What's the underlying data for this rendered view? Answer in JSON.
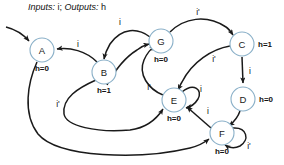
{
  "title": {
    "inputs_label": "Inputs:",
    "inputs_value": "i;",
    "outputs_label": "Outputs:",
    "outputs_value": "h"
  },
  "diagram": {
    "kind": "finite-state-machine",
    "stroke_color": "#1a1a1a",
    "state_stroke_color": "#8ab0c8",
    "state_fill_color": "#ffffff"
  },
  "states": [
    {
      "id": "A",
      "name": "A",
      "output": "h=0",
      "cx": 42,
      "cy": 50,
      "r": 12,
      "output_dx": 0,
      "output_dy": 18
    },
    {
      "id": "B",
      "name": "B",
      "output": "h=1",
      "cx": 104,
      "cy": 72,
      "r": 12,
      "output_dx": 0,
      "output_dy": 18
    },
    {
      "id": "G",
      "name": "G",
      "output": "h=0",
      "cx": 161,
      "cy": 41,
      "r": 12,
      "output_dx": 0,
      "output_dy": 18
    },
    {
      "id": "C",
      "name": "C",
      "output": "h=1",
      "cx": 242,
      "cy": 44,
      "r": 12,
      "output_dx": 24,
      "output_dy": 0
    },
    {
      "id": "D",
      "name": "D",
      "output": "h=0",
      "cx": 243,
      "cy": 99,
      "r": 12,
      "output_dx": 24,
      "output_dy": 0
    },
    {
      "id": "E",
      "name": "E",
      "output": "h=0",
      "cx": 174,
      "cy": 100,
      "r": 12,
      "output_dx": 0,
      "output_dy": 18
    },
    {
      "id": "F",
      "name": "F",
      "output": "h=0",
      "cx": 222,
      "cy": 133,
      "r": 12,
      "output_dx": 0,
      "output_dy": 18
    }
  ],
  "transitions": [
    {
      "id": "init-A",
      "from": "",
      "to": "A",
      "label": "",
      "label_x": 0,
      "label_y": 0
    },
    {
      "id": "B-to-A",
      "from": "B",
      "to": "A",
      "label": "i",
      "label_x": 78,
      "label_y": 44
    },
    {
      "id": "G-to-B",
      "from": "G",
      "to": "B",
      "label": "i",
      "label_x": 120,
      "label_y": 22
    },
    {
      "id": "B-to-G",
      "from": "B",
      "to": "G",
      "label": "",
      "label_x": 0,
      "label_y": 0
    },
    {
      "id": "G-to-C",
      "from": "G",
      "to": "C",
      "label": "i'",
      "label_x": 198,
      "label_y": 12
    },
    {
      "id": "E-to-G",
      "from": "E",
      "to": "G",
      "label": "i'",
      "label_x": 149,
      "label_y": 87
    },
    {
      "id": "C-to-E",
      "from": "C",
      "to": "E",
      "label": "i'",
      "label_x": 214,
      "label_y": 59
    },
    {
      "id": "C-to-D",
      "from": "C",
      "to": "D",
      "label": "i",
      "label_x": 250,
      "label_y": 71
    },
    {
      "id": "D-to-F",
      "from": "D",
      "to": "F",
      "label": "",
      "label_x": 0,
      "label_y": 0
    },
    {
      "id": "E-to-E",
      "from": "E",
      "to": "E",
      "label": "i",
      "label_x": 201,
      "label_y": 89
    },
    {
      "id": "F-to-E",
      "from": "F",
      "to": "E",
      "label": "i",
      "label_x": 208,
      "label_y": 111
    },
    {
      "id": "F-to-F",
      "from": "F",
      "to": "F",
      "label": "i'",
      "label_x": 249,
      "label_y": 146
    },
    {
      "id": "B-to-E",
      "from": "B",
      "to": "E",
      "label": "i'",
      "label_x": 58,
      "label_y": 104
    },
    {
      "id": "A-to-F",
      "from": "A",
      "to": "F",
      "label": "",
      "label_x": 0,
      "label_y": 0
    }
  ]
}
